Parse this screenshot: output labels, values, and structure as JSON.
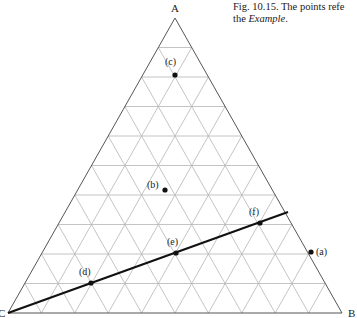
{
  "caption": {
    "line1": "Fig. 10.15.  The points refe",
    "line2_prefix": "the ",
    "line2_italic": "Example",
    "line2_suffix": "."
  },
  "diagram": {
    "type": "ternary",
    "grid_divisions": 10,
    "vertices": {
      "A": {
        "label": "A",
        "x": 175,
        "y": 18
      },
      "B": {
        "label": "B",
        "x": 342,
        "y": 313
      },
      "C": {
        "label": "C",
        "x": 8,
        "y": 313
      }
    },
    "points": [
      {
        "id": "a",
        "label": "(a)",
        "x": 311,
        "y": 252,
        "label_dx": 5,
        "label_dy": 3
      },
      {
        "id": "b",
        "label": "(b)",
        "x": 165,
        "y": 190,
        "label_dx": -18,
        "label_dy": -2
      },
      {
        "id": "c",
        "label": "(c)",
        "x": 175,
        "y": 75,
        "label_dx": -10,
        "label_dy": -10
      },
      {
        "id": "d",
        "label": "(d)",
        "x": 91,
        "y": 283,
        "label_dx": -12,
        "label_dy": -8
      },
      {
        "id": "e",
        "label": "(e)",
        "x": 176,
        "y": 253,
        "label_dx": -9,
        "label_dy": -8
      },
      {
        "id": "f",
        "label": "(f)",
        "x": 260,
        "y": 223,
        "label_dx": -11,
        "label_dy": -8
      }
    ],
    "line": {
      "x1": 8,
      "y1": 313,
      "x2": 288,
      "y2": 212
    },
    "colors": {
      "grid": "#b5b5b5",
      "edge": "#555555",
      "ink": "#111111"
    }
  }
}
